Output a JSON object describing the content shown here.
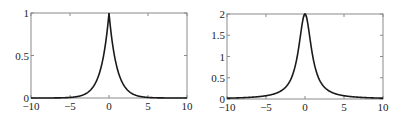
{
  "chart_data": [
    {
      "type": "line",
      "title": "",
      "xlabel": "",
      "ylabel": "",
      "xlim": [
        -10,
        10
      ],
      "ylim": [
        0,
        1
      ],
      "xticks": [
        -10,
        -5,
        0,
        5,
        10
      ],
      "xtick_labels": [
        "−10",
        "−5",
        "0",
        "5",
        "10"
      ],
      "yticks": [
        0,
        0.5,
        1
      ],
      "ytick_labels": [
        "0",
        "0.5",
        "1"
      ],
      "grid": false,
      "legend": null,
      "series": [
        {
          "name": "exp(-|x|)",
          "function": "laplace",
          "x": [
            -10,
            -5,
            -3,
            -2,
            -1,
            -0.5,
            0,
            0.5,
            1,
            2,
            3,
            5,
            10
          ],
          "values": [
            0.0,
            0.007,
            0.05,
            0.135,
            0.368,
            0.607,
            1.0,
            0.607,
            0.368,
            0.135,
            0.05,
            0.007,
            0.0
          ]
        }
      ],
      "box": {
        "left": 31,
        "top": 13,
        "right": 187,
        "bottom": 98
      }
    },
    {
      "type": "line",
      "title": "",
      "xlabel": "",
      "ylabel": "",
      "xlim": [
        -10,
        10
      ],
      "ylim": [
        0,
        2
      ],
      "xticks": [
        -10,
        -5,
        0,
        5,
        10
      ],
      "xtick_labels": [
        "−10",
        "−5",
        "0",
        "5",
        "10"
      ],
      "yticks": [
        0,
        0.5,
        1,
        1.5,
        2
      ],
      "ytick_labels": [
        "0",
        "0.5",
        "1",
        "1.5",
        "2"
      ],
      "grid": false,
      "legend": null,
      "series": [
        {
          "name": "2/(1+x^2)",
          "function": "cauchy",
          "x": [
            -10,
            -5,
            -3,
            -2,
            -1,
            -0.5,
            0,
            0.5,
            1,
            2,
            3,
            5,
            10
          ],
          "values": [
            0.02,
            0.077,
            0.2,
            0.4,
            1.0,
            1.6,
            2.0,
            1.6,
            1.0,
            0.4,
            0.2,
            0.077,
            0.02
          ]
        }
      ],
      "box": {
        "left": 227,
        "top": 14,
        "right": 383,
        "bottom": 99
      }
    }
  ]
}
